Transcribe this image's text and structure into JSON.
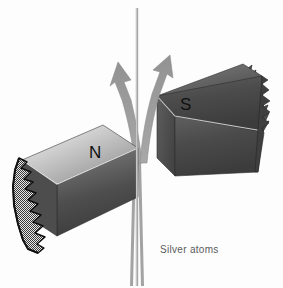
{
  "figure": {
    "background_color": "#fdfdfd",
    "width": 283,
    "height": 288
  },
  "magnets": {
    "north": {
      "label": "N",
      "pole_name": "north-pole",
      "position": "left",
      "face_color_light": "#d9d9d9",
      "face_color_dark": "#3f3f3f",
      "broken_end": "left",
      "broken_end_fill": "#8a8a8a",
      "outline_color": "#111111"
    },
    "south": {
      "label": "S",
      "pole_name": "south-pole",
      "position": "right",
      "face_color_light": "#c9c9c9",
      "face_color_dark": "#3a3a3a",
      "broken_end": "right",
      "outline_color": "#111111"
    }
  },
  "beam": {
    "caption": "Silver atoms",
    "axis_line_color": "#9a9a9a",
    "arrow_color": "#9c9c9c",
    "arrow_outline": "#8a8a8a",
    "arrows": [
      {
        "name": "deflected-up-left",
        "direction": "up-left"
      },
      {
        "name": "deflected-up-right",
        "direction": "up-right"
      }
    ]
  },
  "colors": {
    "background": "#fdfdfd",
    "text": "#111111",
    "caption_text": "#5b5b5b",
    "beam_gray": "#9c9c9c",
    "magnet_dark": "#3a3a3a",
    "magnet_light": "#d9d9d9"
  }
}
